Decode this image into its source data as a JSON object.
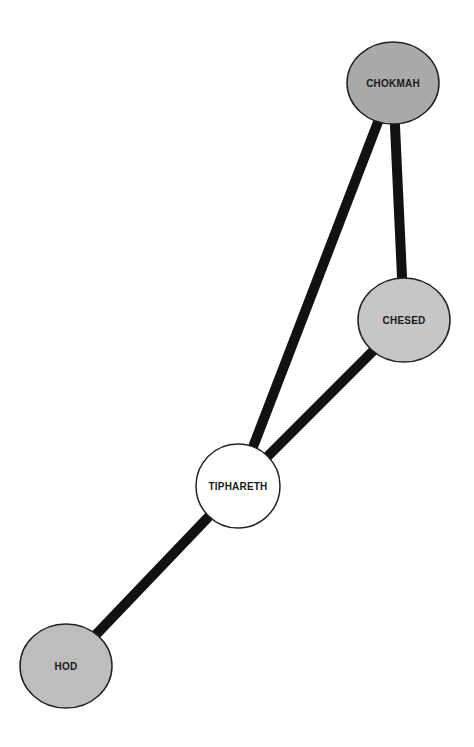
{
  "diagram": {
    "type": "network-graph",
    "background": "#ffffff",
    "edge_color": "#111111",
    "nodes": [
      {
        "id": "chokmah",
        "label": "CHOKMAH",
        "cx": 393,
        "cy": 83,
        "rx": 46,
        "ry": 41,
        "fill": "#a9a9a9"
      },
      {
        "id": "chesed",
        "label": "CHESED",
        "cx": 404,
        "cy": 320,
        "rx": 46,
        "ry": 42,
        "fill": "#c6c6c6"
      },
      {
        "id": "tiphareth",
        "label": "TIPHARETH",
        "cx": 238,
        "cy": 486,
        "rx": 42,
        "ry": 42,
        "fill": "#ffffff"
      },
      {
        "id": "hod",
        "label": "HOD",
        "cx": 66,
        "cy": 666,
        "rx": 46,
        "ry": 42,
        "fill": "#bdbdbd"
      }
    ],
    "edges": [
      {
        "from": "chokmah",
        "to": "chesed",
        "width": 10
      },
      {
        "from": "chokmah",
        "to": "tiphareth",
        "width": 10
      },
      {
        "from": "chesed",
        "to": "tiphareth",
        "width": 10
      },
      {
        "from": "tiphareth",
        "to": "hod",
        "width": 10
      }
    ]
  }
}
